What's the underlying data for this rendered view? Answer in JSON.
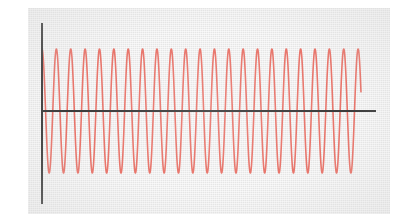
{
  "figure": {
    "panel": {
      "x": 28,
      "y": 8,
      "width": 362,
      "height": 206,
      "background_color": "#e6e6e6"
    },
    "page_background_color": "#ffffff"
  },
  "axes": {
    "color": "#3b3b3b",
    "line_width": 2,
    "y_axis": {
      "x": 14,
      "y_top": 15,
      "y_bottom": 196
    },
    "x_axis": {
      "y": 103,
      "x_left": 14,
      "x_right": 348
    },
    "tick_labels_x": [],
    "tick_labels_y": [],
    "grid": false
  },
  "chart_data": {
    "type": "line",
    "title": "",
    "subtitle": "",
    "xlabel": "",
    "ylabel": "",
    "grid": false,
    "legend": null,
    "annotations": [],
    "xlim": [
      0,
      22.2
    ],
    "ylim": [
      -1.12,
      1.12
    ],
    "axis_tick_labels": {
      "x": [],
      "y": []
    },
    "series": [
      {
        "name": "sinusoid",
        "color": "#e8756b",
        "line_width": 1.6,
        "waveform": "cosine",
        "amplitude": 1.0,
        "cycles": 22.2,
        "phase_degrees": 0,
        "x_start": 0,
        "x_end": 22.2,
        "samples": 2400,
        "description": "constant-amplitude high-frequency sinusoid starting at a positive peak on the y-axis"
      }
    ]
  }
}
